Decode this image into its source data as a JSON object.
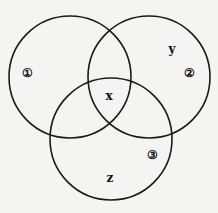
{
  "diagram": {
    "type": "venn-three-sets",
    "circles": [
      {
        "id": "1",
        "label": "①",
        "cx": 70,
        "cy": 77,
        "r": 61
      },
      {
        "id": "2",
        "label": "②",
        "cx": 149,
        "cy": 77,
        "r": 61
      },
      {
        "id": "3",
        "label": "③",
        "cx": 111,
        "cy": 139,
        "r": 61
      }
    ],
    "region_labels": {
      "x": "x",
      "y": "y",
      "z": "z"
    },
    "stroke_color": "#1a1a1a",
    "background_color": "#f4f4f2"
  }
}
